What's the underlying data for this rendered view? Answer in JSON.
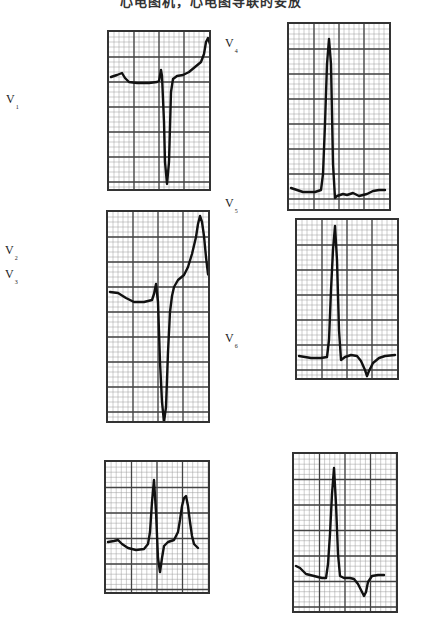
{
  "figure": {
    "title": "心电图机，心电图导联的安放",
    "grid": {
      "major_color": "#444444",
      "minor_color": "#9a9a9a",
      "minor_per_major": 5
    },
    "trace_color": "#111111",
    "labels": [
      {
        "id": "V1",
        "letter": "V",
        "sub": "1",
        "x": 6,
        "y": 93
      },
      {
        "id": "V2",
        "letter": "V",
        "sub": "2",
        "x": 5,
        "y": 244
      },
      {
        "id": "V3",
        "letter": "V",
        "sub": "3",
        "x": 5,
        "y": 268
      },
      {
        "id": "V4",
        "letter": "V",
        "sub": "4",
        "x": 225,
        "y": 37
      },
      {
        "id": "V5",
        "letter": "V",
        "sub": "5",
        "x": 225,
        "y": 197
      },
      {
        "id": "V6",
        "letter": "V",
        "sub": "6",
        "x": 225,
        "y": 332
      }
    ],
    "panels": [
      {
        "lead": "V1",
        "x": 107,
        "y": 30,
        "w": 104,
        "h": 161,
        "cols": 4,
        "rows": 6.2,
        "trace": "2,45 8,43 13,41 16,46 20,50 28,51 40,51 48,50 50,49 52,38 53,44 55,90 56,130 58,152 60,130 62,60 64,47 68,44 74,43 80,40 86,35 92,30 95,22 97,10 99,6 101,12 103,28 106,40 110,46"
      },
      {
        "lead": "V4",
        "x": 287,
        "y": 22,
        "w": 104,
        "h": 189,
        "cols": 4,
        "rows": 7.2,
        "trace": "2,164 8,166 14,168 26,168 32,166 34,150 36,100 38,40 40,15 42,40 44,140 46,174 48,172 54,170 58,171 64,169 70,172 78,170 84,167 90,166 96,166"
      },
      {
        "lead": "V2",
        "x": 106,
        "y": 210,
        "w": 104,
        "h": 213,
        "cols": 4,
        "rows": 8.1,
        "trace": "2,80 10,81 18,86 26,90 36,90 44,88 46,82 48,72 50,90 52,150 54,190 56,210 58,195 60,140 62,100 64,84 66,75 70,68 76,63 80,55 84,42 88,25 90,12 92,4 94,10 96,24 98,45 100,62 104,68"
      },
      {
        "lead": "V5",
        "x": 295,
        "y": 218,
        "w": 104,
        "h": 162,
        "cols": 4,
        "rows": 6.2,
        "trace": "2,136 8,137 14,138 24,138 30,137 32,120 34,70 36,30 38,6 40,40 42,110 44,140 48,137 54,135 60,136 64,141 68,150 70,156 72,151 76,143 82,138 88,136 98,135"
      },
      {
        "lead": "V3",
        "x": 104,
        "y": 460,
        "w": 106,
        "h": 134,
        "cols": 4,
        "rows": 5.1,
        "trace": "2,80 8,79 12,78 16,82 22,86 30,88 38,87 42,82 44,70 46,40 48,18 50,50 52,96 54,110 56,96 58,84 62,80 68,78 72,70 74,58 76,44 78,36 80,34 82,44 84,60 86,74 88,82 92,86"
      },
      {
        "lead": "V6",
        "x": 292,
        "y": 452,
        "w": 106,
        "h": 161,
        "cols": 4,
        "rows": 6.1,
        "trace": "2,112 6,114 12,120 20,122 28,124 32,124 34,110 36,80 38,40 40,14 42,50 44,100 46,122 50,124 56,124 60,125 64,130 68,138 70,142 72,138 74,128 78,122 84,121 90,121"
      }
    ]
  }
}
